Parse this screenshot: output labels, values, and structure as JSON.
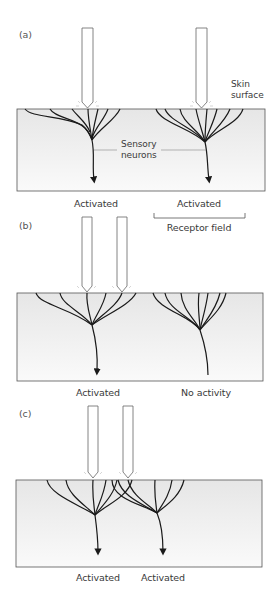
{
  "figure": {
    "panels": [
      {
        "id": "a",
        "label": "(a)",
        "probes": 2,
        "outcomes": [
          "Activated",
          "Activated"
        ],
        "annotations": {
          "skin_surface": [
            "Skin",
            "surface"
          ],
          "sensory_neurons": [
            "Sensory",
            "neurons"
          ],
          "receptor_field": "Receptor field"
        }
      },
      {
        "id": "b",
        "label": "(b)",
        "probes": 2,
        "outcomes": [
          "Activated",
          "No activity"
        ]
      },
      {
        "id": "c",
        "label": "(c)",
        "probes": 2,
        "outcomes": [
          "Activated",
          "Activated"
        ]
      }
    ],
    "colors": {
      "skin_fill": "#ececec",
      "skin_border": "#555555",
      "neuron_stroke": "#1a1a1a",
      "probe_stroke": "#666666",
      "text": "#3a3a3a"
    }
  }
}
